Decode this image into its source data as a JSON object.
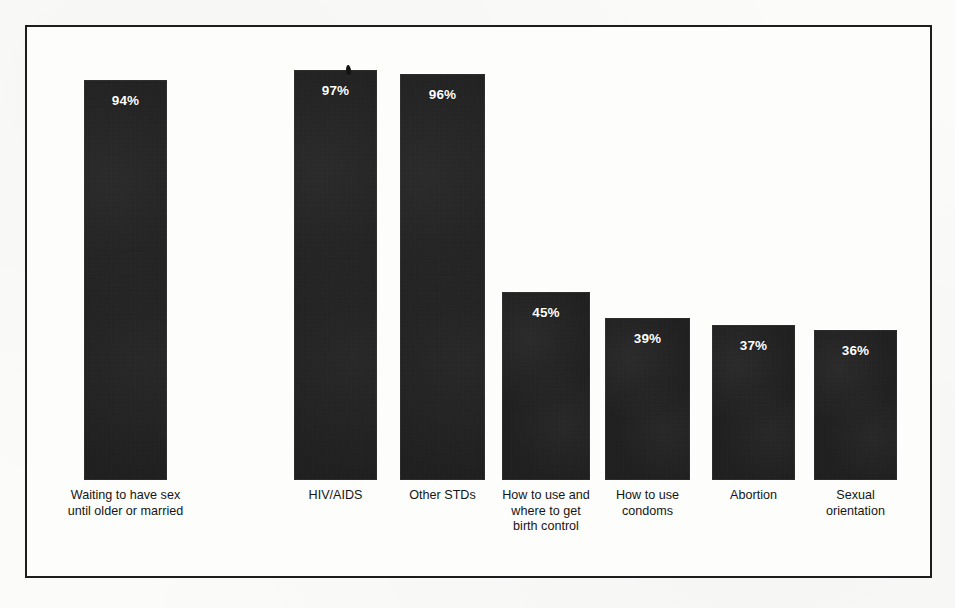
{
  "chart_data": {
    "type": "bar",
    "title": "",
    "subtitle": "",
    "xlabel": "",
    "ylabel": "",
    "ylim": [
      0,
      100
    ],
    "grid": false,
    "legend": false,
    "value_label_suffix": "%",
    "categories": [
      "Waiting to have sex\nuntil older or married",
      "HIV/AIDS",
      "Other STDs",
      "How to use and\nwhere to get\nbirth control",
      "How to use\ncondoms",
      "Abortion",
      "Sexual\norientation"
    ],
    "values": [
      94,
      97,
      96,
      45,
      39,
      37,
      36
    ],
    "value_labels": [
      "94%",
      "97%",
      "96%",
      "45%",
      "39%",
      "37%",
      "36%"
    ],
    "bars": [
      {
        "label": "Waiting to have sex\nuntil older or married",
        "value": 94,
        "value_label": "94%",
        "x": 82,
        "width": 83,
        "top": 78
      },
      {
        "label": "HIV/AIDS",
        "value": 97,
        "value_label": "97%",
        "x": 292,
        "width": 83,
        "top": 68
      },
      {
        "label": "Other STDs",
        "value": 96,
        "value_label": "96%",
        "x": 398,
        "width": 85,
        "top": 72
      },
      {
        "label": "How to use and\nwhere to get\nbirth control",
        "value": 45,
        "value_label": "45%",
        "x": 500,
        "width": 88,
        "top": 290
      },
      {
        "label": "How to use\ncondoms",
        "value": 39,
        "value_label": "39%",
        "x": 603,
        "width": 85,
        "top": 316
      },
      {
        "label": "Abortion",
        "value": 37,
        "value_label": "37%",
        "x": 710,
        "width": 83,
        "top": 323
      },
      {
        "label": "Sexual\norientation",
        "value": 36,
        "value_label": "36%",
        "x": 812,
        "width": 83,
        "top": 328
      }
    ],
    "baseline_y": 478,
    "colors": {
      "bar": "#1b1b1b",
      "value_text": "#ffffff",
      "label_text": "#151515",
      "frame": "#1d1d1d",
      "background": "#fdfdfc"
    }
  }
}
